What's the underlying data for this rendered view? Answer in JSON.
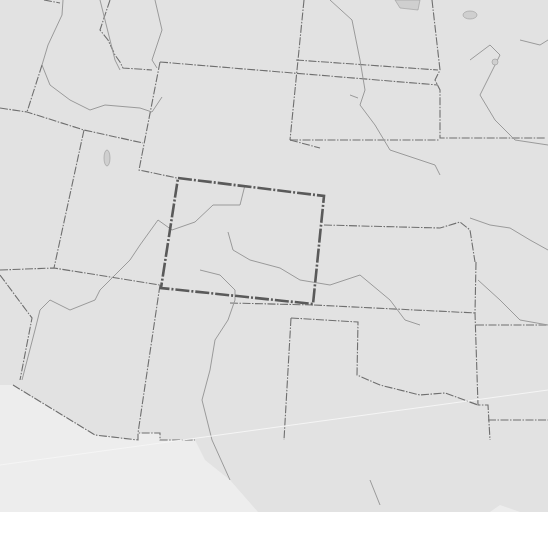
{
  "map": {
    "type": "outline-map",
    "region": "Western and Central United States",
    "highlighted_region": "Colorado",
    "colors": {
      "land": "#e2e2e2",
      "mexico": "#ededed",
      "background": "#ffffff",
      "state_borders": "#6f6f6f",
      "rivers": "#9a9a9a",
      "highlight_border": "#5a5a5a"
    },
    "labels": []
  }
}
